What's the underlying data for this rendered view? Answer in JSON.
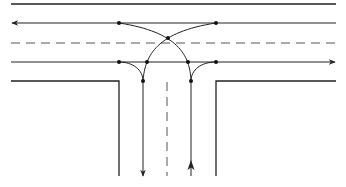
{
  "diagram": {
    "colors": {
      "background": "#ffffff",
      "stroke": "#222222",
      "dashed": "#555555"
    },
    "main_road": {
      "top_edge_y": 4,
      "westbound_lane_y": 23,
      "center_dashed_y": 43,
      "eastbound_lane_y": 62,
      "bottom_edge_y": 81,
      "x_start": 11,
      "x_end": 336,
      "westbound_direction": "left",
      "eastbound_direction": "right"
    },
    "side_road": {
      "left_edge_x": 119,
      "southbound_lane_x": 143,
      "center_dashed_x": 167,
      "northbound_lane_x": 191,
      "right_edge_x": 216,
      "y_end": 176,
      "southbound_direction": "down",
      "northbound_direction": "up"
    },
    "conflict_points": [
      {
        "x": 119,
        "y": 23
      },
      {
        "x": 216,
        "y": 23
      },
      {
        "x": 168,
        "y": 38
      },
      {
        "x": 119,
        "y": 62
      },
      {
        "x": 147,
        "y": 62
      },
      {
        "x": 188,
        "y": 62
      },
      {
        "x": 216,
        "y": 62
      },
      {
        "x": 143,
        "y": 81
      },
      {
        "x": 191,
        "y": 81
      }
    ]
  }
}
